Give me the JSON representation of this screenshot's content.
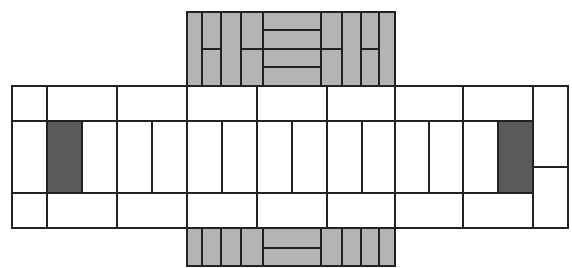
{
  "diagram": {
    "title": "",
    "colors": {
      "line": "#222222",
      "white_fill": "#ffffff",
      "gray_fill": "#b4b4b4",
      "dark_fill": "#5a5a5a"
    },
    "cells": [
      {
        "id": "top-1",
        "x": 187,
        "y": 12,
        "w": 15,
        "h": 74,
        "fill": "gray"
      },
      {
        "id": "top-2a",
        "x": 202,
        "y": 12,
        "w": 19,
        "h": 37,
        "fill": "gray"
      },
      {
        "id": "top-2b",
        "x": 202,
        "y": 49,
        "w": 19,
        "h": 37,
        "fill": "gray"
      },
      {
        "id": "top-3",
        "x": 221,
        "y": 12,
        "w": 20,
        "h": 74,
        "fill": "gray"
      },
      {
        "id": "top-4a",
        "x": 241,
        "y": 12,
        "w": 22,
        "h": 37,
        "fill": "gray"
      },
      {
        "id": "top-4b",
        "x": 241,
        "y": 49,
        "w": 22,
        "h": 37,
        "fill": "gray"
      },
      {
        "id": "top-5a",
        "x": 263,
        "y": 12,
        "w": 58,
        "h": 18,
        "fill": "gray"
      },
      {
        "id": "top-5b",
        "x": 263,
        "y": 30,
        "w": 58,
        "h": 19,
        "fill": "gray"
      },
      {
        "id": "top-5c",
        "x": 263,
        "y": 49,
        "w": 58,
        "h": 18,
        "fill": "gray"
      },
      {
        "id": "top-5d",
        "x": 263,
        "y": 67,
        "w": 58,
        "h": 19,
        "fill": "gray"
      },
      {
        "id": "top-6a",
        "x": 321,
        "y": 12,
        "w": 21,
        "h": 37,
        "fill": "gray"
      },
      {
        "id": "top-6b",
        "x": 321,
        "y": 49,
        "w": 21,
        "h": 37,
        "fill": "gray"
      },
      {
        "id": "top-7",
        "x": 342,
        "y": 12,
        "w": 19,
        "h": 74,
        "fill": "gray"
      },
      {
        "id": "top-8a",
        "x": 361,
        "y": 12,
        "w": 18,
        "h": 37,
        "fill": "gray"
      },
      {
        "id": "top-8b",
        "x": 361,
        "y": 49,
        "w": 18,
        "h": 37,
        "fill": "gray"
      },
      {
        "id": "top-9",
        "x": 379,
        "y": 12,
        "w": 16,
        "h": 74,
        "fill": "gray"
      },
      {
        "id": "r1-1",
        "x": 12,
        "y": 86,
        "w": 35,
        "h": 35,
        "fill": "white"
      },
      {
        "id": "r1-2",
        "x": 47,
        "y": 86,
        "w": 70,
        "h": 35,
        "fill": "white"
      },
      {
        "id": "r1-3",
        "x": 117,
        "y": 86,
        "w": 70,
        "h": 35,
        "fill": "white"
      },
      {
        "id": "r1-4",
        "x": 187,
        "y": 86,
        "w": 70,
        "h": 35,
        "fill": "white"
      },
      {
        "id": "r1-5",
        "x": 257,
        "y": 86,
        "w": 70,
        "h": 35,
        "fill": "white"
      },
      {
        "id": "r1-6",
        "x": 327,
        "y": 86,
        "w": 68,
        "h": 35,
        "fill": "white"
      },
      {
        "id": "r1-7",
        "x": 395,
        "y": 86,
        "w": 68,
        "h": 35,
        "fill": "white"
      },
      {
        "id": "r1-8",
        "x": 463,
        "y": 86,
        "w": 70,
        "h": 35,
        "fill": "white"
      },
      {
        "id": "r2-1",
        "x": 12,
        "y": 121,
        "w": 35,
        "h": 72,
        "fill": "white"
      },
      {
        "id": "r2-2",
        "x": 47,
        "y": 121,
        "w": 35,
        "h": 72,
        "fill": "dark"
      },
      {
        "id": "r2-3",
        "x": 82,
        "y": 121,
        "w": 35,
        "h": 72,
        "fill": "white"
      },
      {
        "id": "r2-4",
        "x": 117,
        "y": 121,
        "w": 35,
        "h": 72,
        "fill": "white"
      },
      {
        "id": "r2-5",
        "x": 152,
        "y": 121,
        "w": 35,
        "h": 72,
        "fill": "white"
      },
      {
        "id": "r2-6",
        "x": 187,
        "y": 121,
        "w": 35,
        "h": 72,
        "fill": "white"
      },
      {
        "id": "r2-7",
        "x": 222,
        "y": 121,
        "w": 35,
        "h": 72,
        "fill": "white"
      },
      {
        "id": "r2-8",
        "x": 257,
        "y": 121,
        "w": 35,
        "h": 72,
        "fill": "white"
      },
      {
        "id": "r2-9",
        "x": 292,
        "y": 121,
        "w": 35,
        "h": 72,
        "fill": "white"
      },
      {
        "id": "r2-10",
        "x": 327,
        "y": 121,
        "w": 35,
        "h": 72,
        "fill": "white"
      },
      {
        "id": "r2-11",
        "x": 362,
        "y": 121,
        "w": 33,
        "h": 72,
        "fill": "white"
      },
      {
        "id": "r2-12",
        "x": 395,
        "y": 121,
        "w": 34,
        "h": 72,
        "fill": "white"
      },
      {
        "id": "r2-13",
        "x": 429,
        "y": 121,
        "w": 34,
        "h": 72,
        "fill": "white"
      },
      {
        "id": "r2-14",
        "x": 463,
        "y": 121,
        "w": 35,
        "h": 72,
        "fill": "white"
      },
      {
        "id": "r2-15",
        "x": 498,
        "y": 121,
        "w": 35,
        "h": 72,
        "fill": "dark"
      },
      {
        "id": "r3-1",
        "x": 12,
        "y": 193,
        "w": 35,
        "h": 35,
        "fill": "white"
      },
      {
        "id": "r3-2",
        "x": 47,
        "y": 193,
        "w": 70,
        "h": 35,
        "fill": "white"
      },
      {
        "id": "r3-3",
        "x": 117,
        "y": 193,
        "w": 70,
        "h": 35,
        "fill": "white"
      },
      {
        "id": "r3-4",
        "x": 187,
        "y": 193,
        "w": 70,
        "h": 35,
        "fill": "white"
      },
      {
        "id": "r3-5",
        "x": 257,
        "y": 193,
        "w": 70,
        "h": 35,
        "fill": "white"
      },
      {
        "id": "r3-6",
        "x": 327,
        "y": 193,
        "w": 68,
        "h": 35,
        "fill": "white"
      },
      {
        "id": "r3-7",
        "x": 395,
        "y": 193,
        "w": 68,
        "h": 35,
        "fill": "white"
      },
      {
        "id": "r3-8",
        "x": 463,
        "y": 193,
        "w": 70,
        "h": 35,
        "fill": "white"
      },
      {
        "id": "right-top",
        "x": 533,
        "y": 86,
        "w": 35,
        "h": 81,
        "fill": "white"
      },
      {
        "id": "right-bottom",
        "x": 533,
        "y": 167,
        "w": 35,
        "h": 61,
        "fill": "white"
      },
      {
        "id": "bot-1",
        "x": 187,
        "y": 228,
        "w": 15,
        "h": 38,
        "fill": "gray"
      },
      {
        "id": "bot-2",
        "x": 202,
        "y": 228,
        "w": 19,
        "h": 38,
        "fill": "gray"
      },
      {
        "id": "bot-3",
        "x": 221,
        "y": 228,
        "w": 20,
        "h": 38,
        "fill": "gray"
      },
      {
        "id": "bot-4",
        "x": 241,
        "y": 228,
        "w": 22,
        "h": 38,
        "fill": "gray"
      },
      {
        "id": "bot-5a",
        "x": 263,
        "y": 228,
        "w": 58,
        "h": 20,
        "fill": "gray"
      },
      {
        "id": "bot-5b",
        "x": 263,
        "y": 248,
        "w": 58,
        "h": 18,
        "fill": "gray"
      },
      {
        "id": "bot-6",
        "x": 321,
        "y": 228,
        "w": 21,
        "h": 38,
        "fill": "gray"
      },
      {
        "id": "bot-7",
        "x": 342,
        "y": 228,
        "w": 19,
        "h": 38,
        "fill": "gray"
      },
      {
        "id": "bot-8",
        "x": 361,
        "y": 228,
        "w": 18,
        "h": 38,
        "fill": "gray"
      },
      {
        "id": "bot-9",
        "x": 379,
        "y": 228,
        "w": 16,
        "h": 38,
        "fill": "gray"
      }
    ]
  }
}
